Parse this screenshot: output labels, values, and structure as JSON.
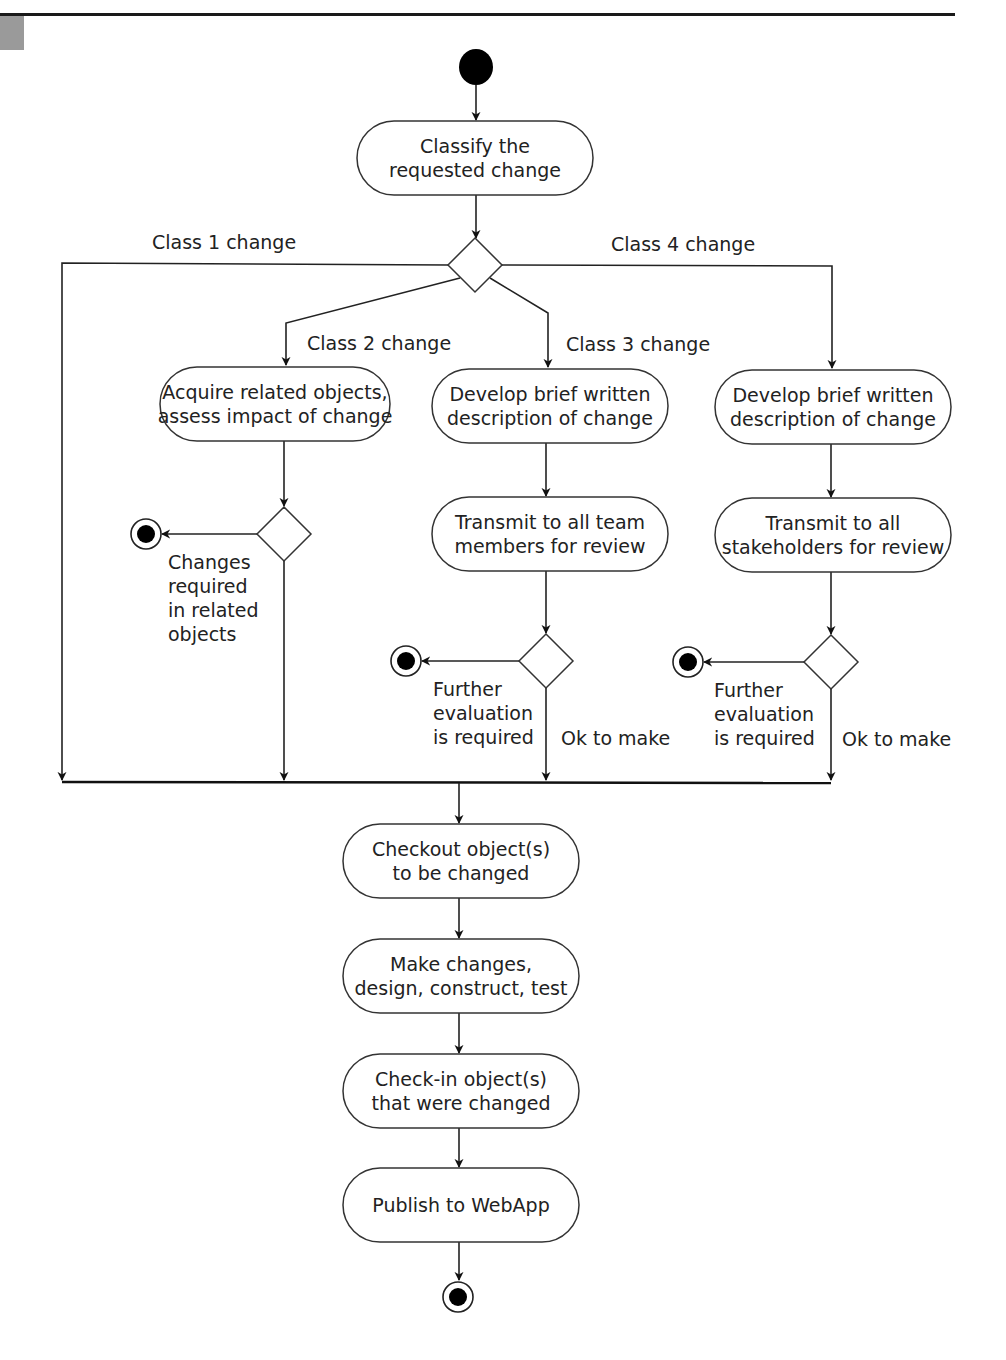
{
  "diagram": {
    "type": "UML activity diagram",
    "colors": {
      "stroke": "#222222",
      "fill": "#ffffff",
      "rule": "#1a1a1a",
      "tab": "#9a9a9a"
    },
    "start_node": {
      "x": 476,
      "y": 67
    },
    "nodes": [
      {
        "id": "classify",
        "lines": [
          "Classify the",
          "requested change"
        ],
        "x": 357,
        "y": 121,
        "w": 236,
        "h": 74
      },
      {
        "id": "acquire",
        "lines": [
          "Acquire related objects,",
          "assess impact of change"
        ],
        "x": 160,
        "y": 367,
        "w": 230,
        "h": 74
      },
      {
        "id": "develop3",
        "lines": [
          "Develop brief written",
          "description of change"
        ],
        "x": 432,
        "y": 369,
        "w": 236,
        "h": 74
      },
      {
        "id": "develop4",
        "lines": [
          "Develop brief written",
          "description of change"
        ],
        "x": 715,
        "y": 370,
        "w": 236,
        "h": 74
      },
      {
        "id": "transmit3",
        "lines": [
          "Transmit to all team",
          "members for review"
        ],
        "x": 432,
        "y": 497,
        "w": 236,
        "h": 74
      },
      {
        "id": "transmit4",
        "lines": [
          "Transmit to all",
          "stakeholders for review"
        ],
        "x": 715,
        "y": 498,
        "w": 236,
        "h": 74
      },
      {
        "id": "checkout",
        "lines": [
          "Checkout object(s)",
          "to be changed"
        ],
        "x": 343,
        "y": 824,
        "w": 236,
        "h": 74
      },
      {
        "id": "make",
        "lines": [
          "Make changes,",
          "design, construct, test"
        ],
        "x": 343,
        "y": 939,
        "w": 236,
        "h": 74
      },
      {
        "id": "checkin",
        "lines": [
          "Check-in object(s)",
          "that were changed"
        ],
        "x": 343,
        "y": 1054,
        "w": 236,
        "h": 74
      },
      {
        "id": "publish",
        "lines": [
          "Publish to WebApp"
        ],
        "x": 343,
        "y": 1168,
        "w": 236,
        "h": 74
      }
    ],
    "decisions": [
      {
        "id": "d-class",
        "cx": 475,
        "cy": 265
      },
      {
        "id": "d-class2",
        "cx": 284,
        "cy": 534
      },
      {
        "id": "d-eval3",
        "cx": 546,
        "cy": 661
      },
      {
        "id": "d-eval4",
        "cx": 831,
        "cy": 662
      }
    ],
    "end_nodes": [
      {
        "id": "end-class2",
        "cx": 146,
        "cy": 534
      },
      {
        "id": "end-eval3",
        "cx": 406,
        "cy": 661
      },
      {
        "id": "end-eval4",
        "cx": 688,
        "cy": 662
      },
      {
        "id": "end-final",
        "cx": 458,
        "cy": 1297
      }
    ],
    "labels": {
      "class1": "Class 1 change",
      "class2": "Class 2 change",
      "class3": "Class 3 change",
      "class4": "Class 4 change",
      "changes_required": [
        "Changes",
        "required",
        "in related",
        "objects"
      ],
      "further_eval_3": [
        "Further",
        "evaluation",
        "is required"
      ],
      "further_eval_4": [
        "Further",
        "evaluation",
        "is required"
      ],
      "ok3": "Ok to make",
      "ok4": "Ok to make"
    },
    "merge_bar": {
      "x1": 62,
      "x2": 830,
      "y": 782
    }
  }
}
